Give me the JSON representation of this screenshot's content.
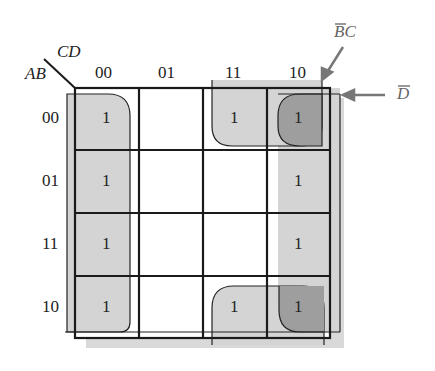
{
  "kmap": {
    "row_var": "AB",
    "col_var": "CD",
    "col_headers": [
      "00",
      "01",
      "11",
      "10"
    ],
    "row_headers": [
      "00",
      "01",
      "11",
      "10"
    ],
    "cells": [
      [
        "1",
        "",
        "1",
        "1"
      ],
      [
        "1",
        "",
        "",
        "1"
      ],
      [
        "1",
        "",
        "",
        "1"
      ],
      [
        "1",
        "",
        "1",
        "1"
      ]
    ]
  },
  "annotations": {
    "bc_bar": "BC",
    "d_bar": "D"
  },
  "colors": {
    "shadow": "#d9d9d9",
    "group_fill": "#d4d4d4",
    "overlap_fill": "#9e9e9e",
    "line": "#1a1a1a"
  }
}
